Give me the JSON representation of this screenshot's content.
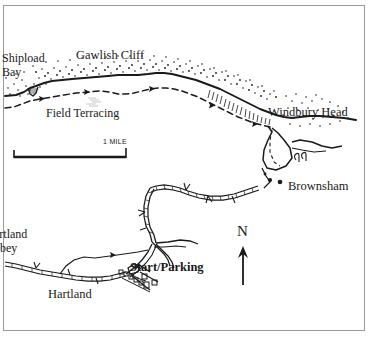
{
  "map": {
    "title": "Hartland Coast Walking Map",
    "background_color": "#ffffff",
    "ink_color": "#1a1a1a",
    "border_color": "#9a9a9a",
    "labels": {
      "shipload_bay_line1": "Shipload",
      "shipload_bay_line2": "Bay",
      "gawlish_cliff": "Gawlish Cliff",
      "field_terracing": "Field Terracing",
      "windbury_head": "Windbury Head",
      "brownsham": "Brownsham",
      "hartland_abbey_line1": "artland",
      "hartland_abbey_line2": "bbey",
      "hartland": "Hartland",
      "start_parking": "Start/Parking",
      "north": "N",
      "scale_label": "1 MILE"
    },
    "legend_semantics": {
      "coastline": "solid heavy line with stipple",
      "footpath": "dashed line with direction arrows",
      "road": "double line with hedgerow hatching",
      "scale_bar": "1 MILE",
      "north_arrow": "N"
    }
  }
}
